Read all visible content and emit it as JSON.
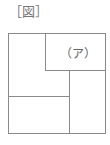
{
  "figure": {
    "caption": "［図］",
    "region_label": "（ア）",
    "line_color": "#8a8a8a"
  }
}
